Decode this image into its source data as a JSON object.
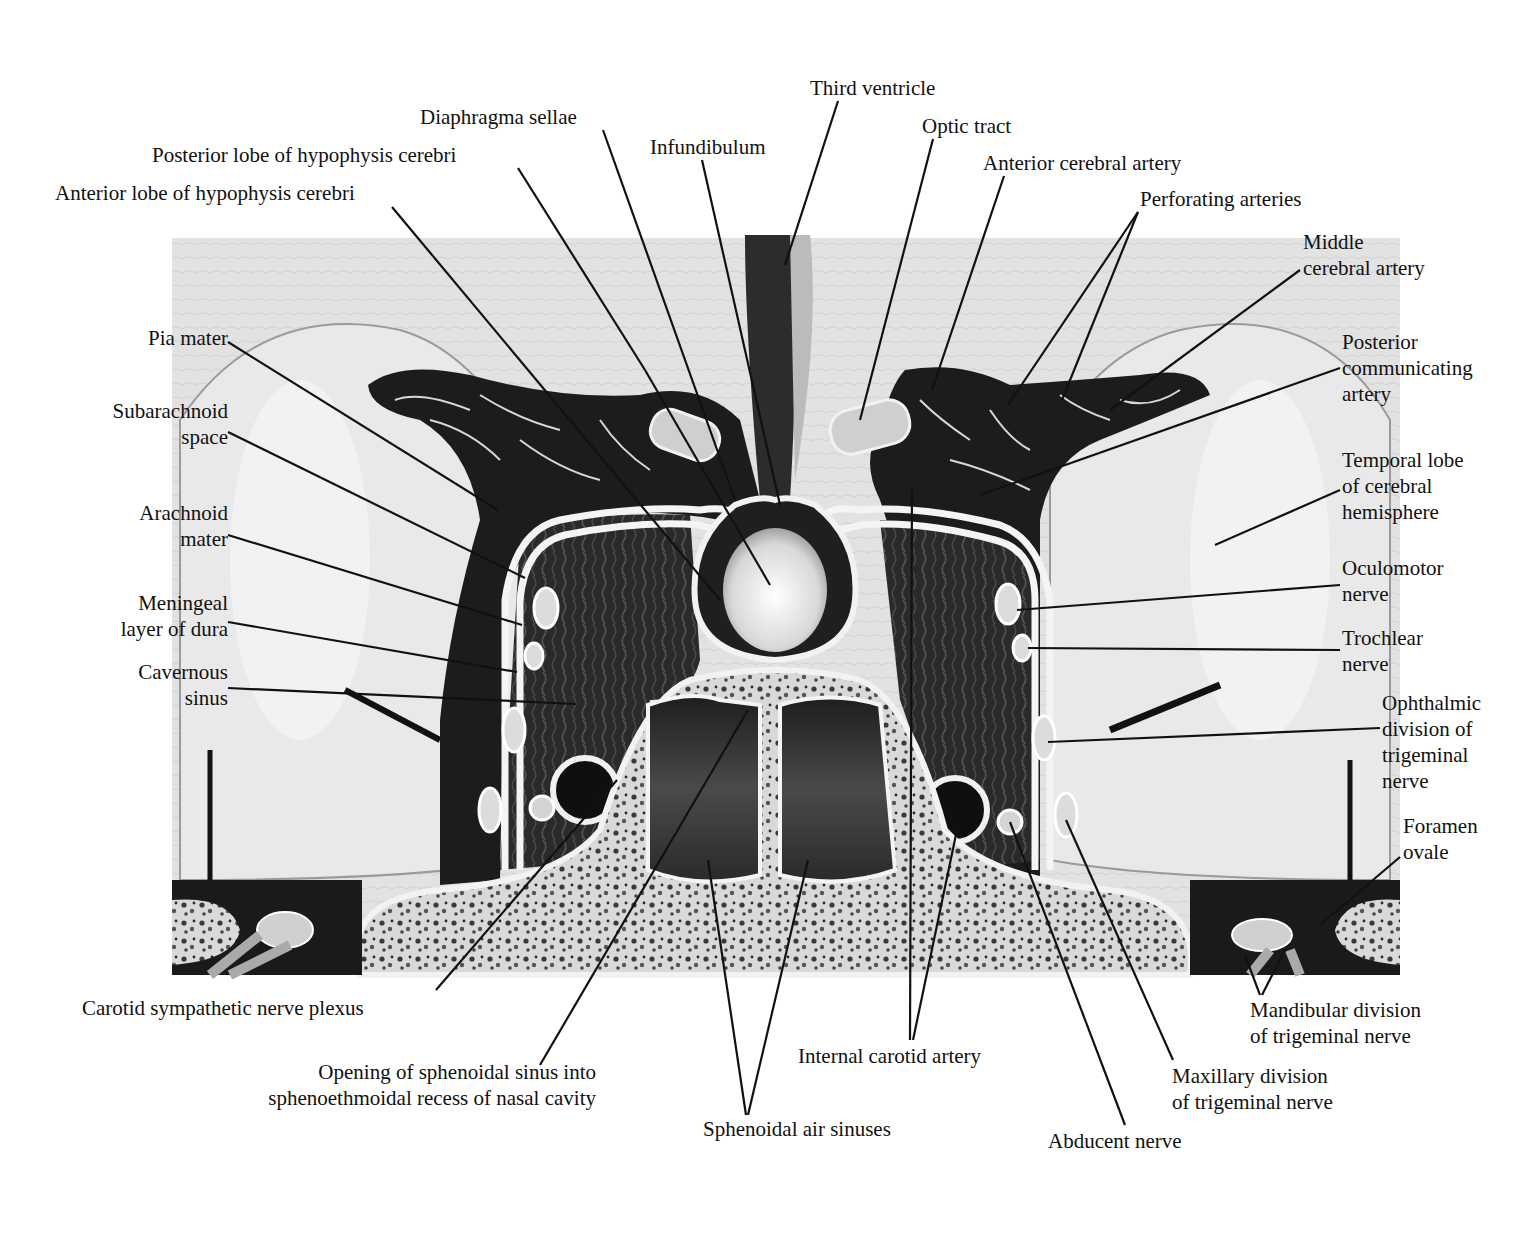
{
  "figure": {
    "colors": {
      "background": "#ffffff",
      "brain": "#dcdcdc",
      "brain_light": "#ececec",
      "dark_tissue": "#1a1a1a",
      "sinus_fill": "#2e2e2e",
      "bone": "#e6e6e6",
      "membrane": "#f4f4f4",
      "leader": "#111111"
    },
    "labels": [
      {
        "id": "third-ventricle",
        "text": "Third ventricle",
        "x": 810,
        "y": 75,
        "align": "l",
        "lines": [
          [
            838,
            101,
            785,
            265
          ]
        ]
      },
      {
        "id": "diaphragma-sellae",
        "text": "Diaphragma sellae",
        "x": 420,
        "y": 104,
        "align": "l",
        "lines": [
          [
            603,
            130,
            735,
            500
          ]
        ]
      },
      {
        "id": "infundibulum",
        "text": "Infundibulum",
        "x": 650,
        "y": 134,
        "align": "l",
        "lines": [
          [
            702,
            160,
            780,
            505
          ]
        ]
      },
      {
        "id": "optic-tract",
        "text": "Optic tract",
        "x": 922,
        "y": 113,
        "align": "l",
        "lines": [
          [
            933,
            139,
            860,
            420
          ]
        ]
      },
      {
        "id": "posterior-lobe",
        "text": "Posterior lobe of hypophysis cerebri",
        "x": 152,
        "y": 142,
        "align": "l",
        "lines": [
          [
            518,
            168,
            645,
            370
          ],
          [
            645,
            370,
            770,
            585
          ]
        ]
      },
      {
        "id": "anterior-cerebral-artery",
        "text": "Anterior cerebral artery",
        "x": 983,
        "y": 150,
        "align": "l",
        "lines": [
          [
            1004,
            176,
            932,
            390
          ]
        ]
      },
      {
        "id": "anterior-lobe",
        "text": "Anterior lobe of hypophysis cerebri",
        "x": 55,
        "y": 180,
        "align": "l",
        "lines": [
          [
            392,
            207,
            720,
            600
          ]
        ]
      },
      {
        "id": "perforating-arteries",
        "text": "Perforating arteries",
        "x": 1140,
        "y": 186,
        "align": "l",
        "lines": [
          [
            1138,
            212,
            1008,
            405
          ],
          [
            1138,
            212,
            1062,
            400
          ]
        ]
      },
      {
        "id": "middle-cerebral-artery",
        "text": "Middle\ncerebral artery",
        "x": 1303,
        "y": 229,
        "align": "l",
        "lines": [
          [
            1300,
            270,
            1110,
            410
          ]
        ]
      },
      {
        "id": "pia-mater",
        "text": "Pia mater",
        "x": 60,
        "y": 325,
        "align": "r",
        "w": 168,
        "lines": [
          [
            228,
            342,
            498,
            510
          ]
        ]
      },
      {
        "id": "posterior-communicating-artery",
        "text": "Posterior\ncommunicating\nartery",
        "x": 1342,
        "y": 329,
        "align": "l",
        "lines": [
          [
            1340,
            368,
            980,
            495
          ]
        ]
      },
      {
        "id": "subarachnoid-space",
        "text": "Subarachnoid\nspace",
        "x": 60,
        "y": 398,
        "align": "r",
        "w": 168,
        "lines": [
          [
            228,
            432,
            525,
            578
          ]
        ]
      },
      {
        "id": "temporal-lobe",
        "text": "Temporal lobe\nof cerebral\nhemisphere",
        "x": 1342,
        "y": 447,
        "align": "l",
        "lines": [
          [
            1340,
            490,
            1215,
            545
          ]
        ]
      },
      {
        "id": "arachnoid-mater",
        "text": "Arachnoid\nmater",
        "x": 60,
        "y": 500,
        "align": "r",
        "w": 168,
        "lines": [
          [
            228,
            535,
            522,
            625
          ]
        ]
      },
      {
        "id": "oculomotor-nerve",
        "text": "Oculomotor\nnerve",
        "x": 1342,
        "y": 555,
        "align": "l",
        "lines": [
          [
            1340,
            585,
            1017,
            610
          ]
        ]
      },
      {
        "id": "meningeal-dura",
        "text": "Meningeal\nlayer of dura",
        "x": 60,
        "y": 590,
        "align": "r",
        "w": 168,
        "lines": [
          [
            228,
            622,
            517,
            672
          ]
        ]
      },
      {
        "id": "trochlear-nerve",
        "text": "Trochlear\nnerve",
        "x": 1342,
        "y": 625,
        "align": "l",
        "lines": [
          [
            1340,
            650,
            1028,
            648
          ]
        ]
      },
      {
        "id": "cavernous-sinus",
        "text": "Cavernous\nsinus",
        "x": 60,
        "y": 659,
        "align": "r",
        "w": 168,
        "lines": [
          [
            228,
            688,
            576,
            704
          ]
        ]
      },
      {
        "id": "ophthalmic-division",
        "text": "Ophthalmic\ndivision of\ntrigeminal\nnerve",
        "x": 1382,
        "y": 690,
        "align": "l",
        "lines": [
          [
            1380,
            728,
            1048,
            742
          ]
        ]
      },
      {
        "id": "foramen-ovale",
        "text": "Foramen\novale",
        "x": 1403,
        "y": 813,
        "align": "l",
        "lines": [
          [
            1400,
            857,
            1320,
            925
          ]
        ]
      },
      {
        "id": "carotid-sympathetic-plexus",
        "text": "Carotid sympathetic nerve plexus",
        "x": 82,
        "y": 995,
        "align": "l",
        "lines": [
          [
            436,
            990,
            617,
            780
          ]
        ]
      },
      {
        "id": "mandibular-division",
        "text": "Mandibular division\nof trigeminal nerve",
        "x": 1250,
        "y": 997,
        "align": "l",
        "lines": [
          [
            1260,
            995,
            1245,
            955
          ],
          [
            1262,
            995,
            1285,
            950
          ]
        ]
      },
      {
        "id": "internal-carotid-artery",
        "text": "Internal carotid artery",
        "x": 798,
        "y": 1043,
        "align": "l",
        "lines": [
          [
            910,
            1040,
            912,
            490
          ],
          [
            913,
            1040,
            958,
            825
          ]
        ]
      },
      {
        "id": "opening-sphenoidal-sinus",
        "text": "Opening of sphenoidal sinus into\nsphenoethmoidal recess of nasal cavity",
        "x": 172,
        "y": 1059,
        "align": "r",
        "w": 424,
        "lines": [
          [
            540,
            1065,
            748,
            710
          ]
        ]
      },
      {
        "id": "maxillary-division",
        "text": "Maxillary division\nof trigeminal nerve",
        "x": 1172,
        "y": 1063,
        "align": "l",
        "lines": [
          [
            1173,
            1060,
            1066,
            820
          ]
        ]
      },
      {
        "id": "sphenoidal-air-sinuses",
        "text": "Sphenoidal air sinuses",
        "x": 703,
        "y": 1116,
        "align": "l",
        "lines": [
          [
            746,
            1115,
            708,
            860
          ],
          [
            748,
            1115,
            808,
            860
          ]
        ]
      },
      {
        "id": "abducent-nerve",
        "text": "Abducent nerve",
        "x": 1048,
        "y": 1128,
        "align": "l",
        "lines": [
          [
            1125,
            1125,
            1010,
            822
          ]
        ]
      }
    ],
    "signature": "td"
  }
}
